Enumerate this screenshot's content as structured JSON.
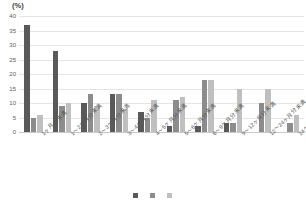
{
  "chart_data": {
    "type": "bar",
    "title": "",
    "subtitle": "",
    "unit_label": "(%)",
    "xlabel": "",
    "ylabel": "",
    "ylim": [
      0,
      40
    ],
    "ytick_step": 5,
    "yticks": [
      "0",
      "5",
      "10",
      "15",
      "20",
      "25",
      "30",
      "35",
      "40"
    ],
    "grid": true,
    "legend_position": "bottom",
    "categories": [
      "1ヶ月分未満",
      "1～2ヶ月分未満",
      "2～3ヶ月分未満",
      "3～4ヶ月分未満",
      "4～5ヶ月分未満",
      "5～6ヶ月分未満",
      "6～9ヶ月分未満",
      "9～12ヶ月分未満",
      "12～24ヶ月分未満",
      "24ヶ月分以上"
    ],
    "series": [
      {
        "name": "系列1",
        "color": "#595959",
        "values": [
          37,
          28,
          10,
          13,
          7,
          2,
          2,
          3,
          0,
          0
        ]
      },
      {
        "name": "系列2",
        "color": "#8c8c8c",
        "values": [
          5,
          9,
          13,
          13,
          5,
          11,
          18,
          3,
          10,
          3
        ]
      },
      {
        "name": "系列3",
        "color": "#bfbfbf",
        "values": [
          6,
          10,
          9,
          8,
          11,
          12,
          18,
          15,
          15,
          6
        ]
      }
    ]
  },
  "legend": {
    "items": [
      {
        "label": "",
        "color": "#595959"
      },
      {
        "label": "",
        "color": "#8c8c8c"
      },
      {
        "label": "",
        "color": "#bfbfbf"
      }
    ]
  }
}
